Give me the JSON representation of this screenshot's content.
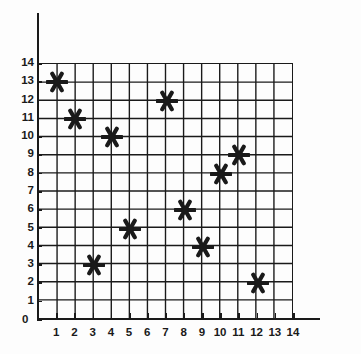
{
  "chart_data": {
    "type": "scatter",
    "title": "",
    "subtitle": "",
    "xlabel": "",
    "ylabel": "",
    "xlim": [
      0,
      14
    ],
    "ylim": [
      0,
      14
    ],
    "grid": true,
    "legend": null,
    "marker": "six-pointed-asterisk",
    "marker_color": "#1a1a1a",
    "grid_color": "#1a1a1a",
    "axis_color": "#1a1a1a",
    "background_color": "#fdfdfd",
    "x": [
      1,
      2,
      3,
      4,
      5,
      7,
      8,
      9,
      10,
      11,
      12
    ],
    "y": [
      13,
      11,
      3,
      10,
      5,
      12,
      6,
      4,
      8,
      9,
      2
    ],
    "points": [
      {
        "x": 1,
        "y": 13
      },
      {
        "x": 2,
        "y": 11
      },
      {
        "x": 3,
        "y": 3
      },
      {
        "x": 4,
        "y": 10
      },
      {
        "x": 5,
        "y": 5
      },
      {
        "x": 7,
        "y": 12
      },
      {
        "x": 8,
        "y": 6
      },
      {
        "x": 9,
        "y": 4
      },
      {
        "x": 10,
        "y": 8
      },
      {
        "x": 11,
        "y": 9
      },
      {
        "x": 12,
        "y": 2
      }
    ],
    "xticks": [
      1,
      2,
      3,
      4,
      5,
      6,
      7,
      8,
      9,
      10,
      11,
      12,
      13,
      14
    ],
    "yticks": [
      0,
      1,
      2,
      3,
      4,
      5,
      6,
      7,
      8,
      9,
      10,
      11,
      12,
      13,
      14
    ],
    "xtick_labels": [
      "1",
      "2",
      "3",
      "4",
      "5",
      "6",
      "7",
      "8",
      "9",
      "10",
      "11",
      "12",
      "13",
      "14"
    ],
    "ytick_labels": [
      "0",
      "1",
      "2",
      "3",
      "4",
      "5",
      "6",
      "7",
      "8",
      "9",
      "10",
      "11",
      "12",
      "13",
      "14"
    ],
    "origin_label": "0"
  }
}
